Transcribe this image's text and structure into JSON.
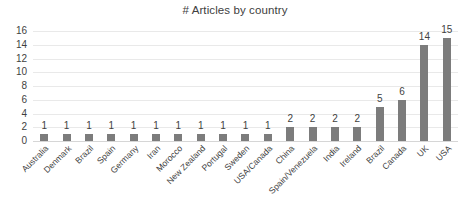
{
  "chart_data": {
    "type": "bar",
    "title": "# Articles by country",
    "xlabel": "",
    "ylabel": "",
    "ylim": [
      0,
      16
    ],
    "yticks": [
      16,
      14,
      12,
      10,
      8,
      6,
      4,
      2,
      0
    ],
    "grid": true,
    "legend": false,
    "orientation": "vertical",
    "bar_color": "#7c7c7c",
    "data_labels": true,
    "categories": [
      "Australia",
      "Denmark",
      "Brazil",
      "Spain",
      "Germany",
      "Iran",
      "Morocco",
      "New Zealand",
      "Portugal",
      "Sweden",
      "USA/Canada",
      "China",
      "Spain/Venezuela",
      "India",
      "Ireland",
      "Brazil",
      "Canada",
      "UK",
      "USA"
    ],
    "values": [
      1,
      1,
      1,
      1,
      1,
      1,
      1,
      1,
      1,
      1,
      1,
      2,
      2,
      2,
      2,
      5,
      6,
      14,
      15
    ]
  }
}
